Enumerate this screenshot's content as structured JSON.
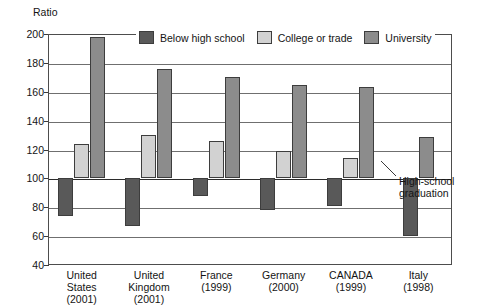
{
  "chart_data": {
    "type": "bar",
    "title": "",
    "ylabel": "Ratio",
    "xlabel": "",
    "ylim": [
      40,
      200
    ],
    "yticks": [
      40,
      60,
      80,
      100,
      120,
      140,
      160,
      180,
      200
    ],
    "grid": true,
    "baseline": 100,
    "baseline_note": "High-school graduation",
    "legend_position": "top-center",
    "categories": [
      "United States (2001)",
      "United Kingdom (2001)",
      "France (1999)",
      "Germany (2000)",
      "CANADA (1999)",
      "Italy (1998)"
    ],
    "series": [
      {
        "name": "Below high school",
        "color": "#595959",
        "values": [
          74,
          67,
          88,
          78,
          81,
          60
        ]
      },
      {
        "name": "College or trade",
        "color": "#d2d2d2",
        "values": [
          124,
          130,
          126,
          119,
          114,
          null
        ]
      },
      {
        "name": "University",
        "color": "#8c8c8c",
        "values": [
          198,
          176,
          170,
          165,
          163,
          129
        ]
      }
    ]
  },
  "axis": {
    "y_title": "Ratio",
    "tick_labels": [
      "200",
      "180",
      "160",
      "140",
      "120",
      "100",
      "80",
      "60",
      "40"
    ]
  },
  "legend": {
    "entries": [
      {
        "label": "Below high school"
      },
      {
        "label": "College or trade"
      },
      {
        "label": "University"
      }
    ]
  },
  "annotation": {
    "line1": "High-school",
    "line2": "graduation"
  },
  "xaxis": {
    "categories": [
      {
        "line1": "United",
        "line2": "States",
        "line3": "(2001)"
      },
      {
        "line1": "United",
        "line2": "Kingdom",
        "line3": "(2001)"
      },
      {
        "line1": "France",
        "line2": "(1999)",
        "line3": ""
      },
      {
        "line1": "Germany",
        "line2": "(2000)",
        "line3": ""
      },
      {
        "line1": "CANADA",
        "line2": "(1999)",
        "line3": ""
      },
      {
        "line1": "Italy",
        "line2": "(1998)",
        "line3": ""
      }
    ]
  }
}
